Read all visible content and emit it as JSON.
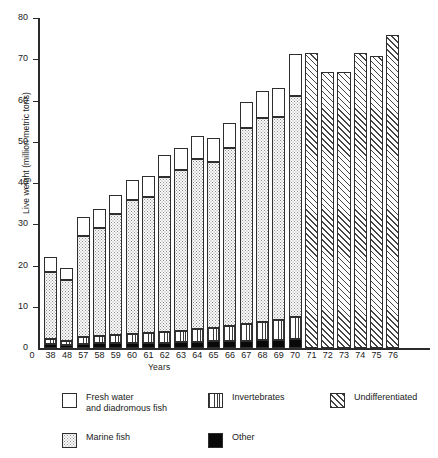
{
  "chart_data": {
    "type": "bar",
    "title": "",
    "subtitle": "",
    "xlabel": "Years",
    "ylabel": "Live weight (million metric tons)",
    "ylim": [
      0,
      80
    ],
    "yticks": [
      0,
      10,
      20,
      30,
      40,
      50,
      60,
      70,
      80
    ],
    "grid": false,
    "stacked": true,
    "legend_position": "below",
    "categories": [
      "38",
      "48",
      "57",
      "58",
      "59",
      "60",
      "61",
      "62",
      "63",
      "64",
      "65",
      "66",
      "67",
      "68",
      "69",
      "70",
      "71",
      "72",
      "73",
      "74",
      "75",
      "76"
    ],
    "series": [
      {
        "name": "Other",
        "pattern": "solid-black",
        "values": [
          1.0,
          0.7,
          1.0,
          1.1,
          1.2,
          1.2,
          1.3,
          1.3,
          1.4,
          1.5,
          1.6,
          1.7,
          1.8,
          1.9,
          2.0,
          2.1,
          0,
          0,
          0,
          0,
          0,
          0
        ]
      },
      {
        "name": "Invertebrates",
        "pattern": "vertical-lines",
        "values": [
          1.3,
          1.0,
          1.6,
          1.7,
          1.9,
          2.1,
          2.3,
          2.5,
          2.7,
          3.0,
          3.3,
          3.6,
          4.0,
          4.4,
          4.8,
          5.5,
          0,
          0,
          0,
          0,
          0,
          0
        ]
      },
      {
        "name": "Marine fish",
        "pattern": "stipple-dots",
        "values": [
          16.2,
          14.8,
          24.6,
          26.4,
          29.3,
          32.5,
          33.0,
          37.6,
          39.1,
          41.4,
          40.2,
          43.1,
          47.5,
          49.5,
          49.2,
          53.6,
          0,
          0,
          0,
          0,
          0,
          0
        ]
      },
      {
        "name": "Fresh water and diadromous fish",
        "pattern": "white",
        "values": [
          3.6,
          2.8,
          4.5,
          4.6,
          4.8,
          5.0,
          5.0,
          5.3,
          5.4,
          5.6,
          5.8,
          6.2,
          6.4,
          6.6,
          7.0,
          10.1,
          0,
          0,
          0,
          0,
          0,
          0
        ]
      },
      {
        "name": "Undifferentiated",
        "pattern": "diagonal-hatch",
        "values": [
          0,
          0,
          0,
          0,
          0,
          0,
          0,
          0,
          0,
          0,
          0,
          0,
          0,
          0,
          0,
          0,
          71.5,
          66.8,
          67.0,
          71.5,
          70.9,
          75.9
        ]
      }
    ],
    "totals": [
      22.1,
      19.3,
      31.7,
      33.8,
      37.2,
      40.8,
      41.6,
      46.7,
      48.6,
      51.5,
      50.9,
      54.6,
      59.7,
      62.4,
      63.0,
      71.3,
      71.5,
      66.8,
      67.0,
      71.5,
      70.9,
      75.9
    ]
  },
  "legend": {
    "items": [
      {
        "label": "Fresh water\nand diadromous fish",
        "pattern": "white"
      },
      {
        "label": "Invertebrates",
        "pattern": "vertical-lines"
      },
      {
        "label": "Undifferentiated",
        "pattern": "diagonal-hatch"
      },
      {
        "label": "Marine fish",
        "pattern": "stipple-dots"
      },
      {
        "label": "Other",
        "pattern": "solid-black"
      }
    ]
  }
}
